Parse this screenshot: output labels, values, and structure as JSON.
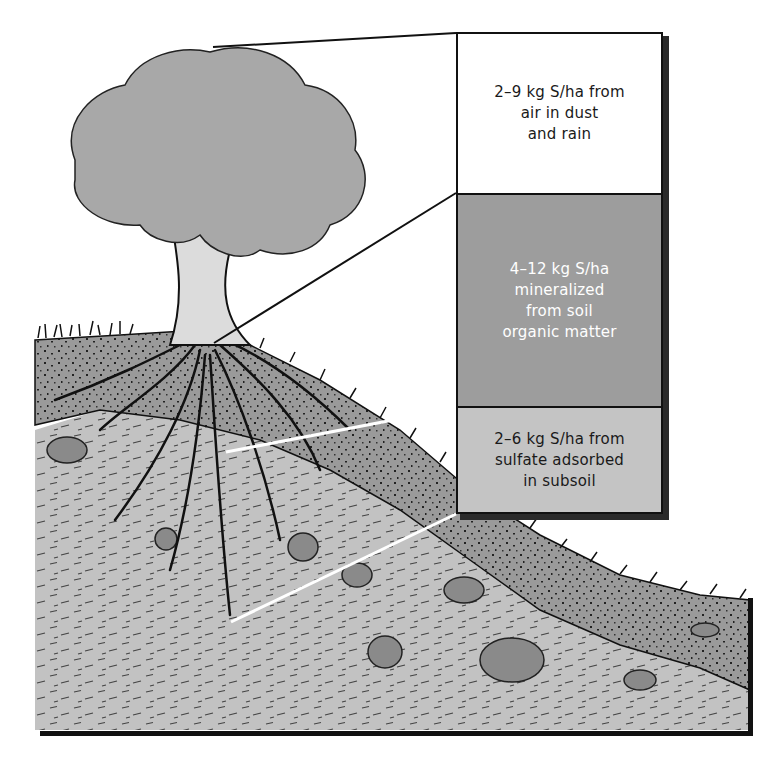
{
  "diagram": {
    "colors": {
      "sky": "#ffffff",
      "foliage": "#a8a8a8",
      "trunk": "#dcdcdc",
      "topsoil": "#9a9a9a",
      "subsoil": "#c0c0c0",
      "rock": "#8a8a8a",
      "box_air": "#ffffff",
      "box_organic": "#9d9d9d",
      "box_subsoil": "#c4c4c4",
      "outline": "#111111"
    },
    "labels": [
      {
        "id": "air",
        "text": "2–9 kg S/ha from\nair in dust\nand rain",
        "points_to": "tree canopy"
      },
      {
        "id": "organic",
        "text": "4–12 kg S/ha\nmineralized\nfrom soil\norganic matter",
        "points_to": "topsoil surface"
      },
      {
        "id": "subsoil",
        "text": "2–6 kg S/ha from\nsulfate adsorbed\nin subsoil",
        "points_to": "subsoil root zone"
      }
    ]
  }
}
